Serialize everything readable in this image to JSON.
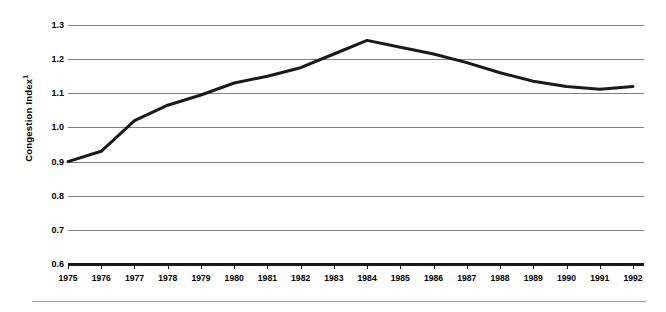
{
  "chart_data": {
    "type": "line",
    "title": "",
    "xlabel": "",
    "ylabel": "Congestion Index",
    "ylabel_superscript": "1",
    "x": [
      1975,
      1976,
      1977,
      1978,
      1979,
      1980,
      1981,
      1982,
      1983,
      1984,
      1985,
      1986,
      1987,
      1988,
      1989,
      1990,
      1991,
      1992
    ],
    "categories": [
      "1975",
      "1976",
      "1977",
      "1978",
      "1979",
      "1980",
      "1981",
      "1982",
      "1983",
      "1984",
      "1985",
      "1986",
      "1987",
      "1988",
      "1989",
      "1990",
      "1991",
      "1992"
    ],
    "values": [
      0.9,
      0.93,
      1.02,
      1.065,
      1.095,
      1.13,
      1.15,
      1.175,
      1.215,
      1.255,
      1.235,
      1.215,
      1.19,
      1.16,
      1.135,
      1.12,
      1.112,
      1.12
    ],
    "series": [
      {
        "name": "Congestion Index",
        "values": [
          0.9,
          0.93,
          1.02,
          1.065,
          1.095,
          1.13,
          1.15,
          1.175,
          1.215,
          1.255,
          1.235,
          1.215,
          1.19,
          1.16,
          1.135,
          1.12,
          1.112,
          1.12
        ],
        "color": "#1a1a1a"
      }
    ],
    "ylim": [
      0.6,
      1.3
    ],
    "xlim": [
      1975,
      1992
    ],
    "ytick_labels": [
      "1.3",
      "1.2",
      "1.1",
      "1.0",
      "0.9",
      "0.8",
      "0.7",
      "0.6"
    ],
    "ytick_values": [
      1.3,
      1.2,
      1.1,
      1.0,
      0.9,
      0.8,
      0.7,
      0.6
    ],
    "ytick_step": 0.1,
    "grid": true,
    "grid_color": "#808080",
    "legend": false,
    "legend_position": "none",
    "line_color": "#1a1a1a",
    "line_width": 3,
    "axis_color": "#1a1a1a",
    "background_color": "#ffffff"
  }
}
